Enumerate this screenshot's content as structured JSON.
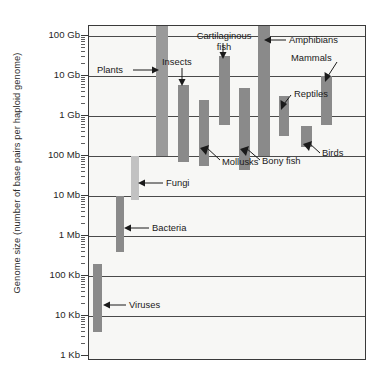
{
  "chart_data": {
    "type": "bar",
    "orientation": "vertical-range",
    "title": "",
    "xlabel": "",
    "ylabel": "Genome size (number of base pairs per haploid genome)",
    "yscale": "log",
    "ylim": [
      1000,
      200000000000
    ],
    "grid": true,
    "legend": "none",
    "ytick_labels": [
      "100 Gb",
      "10 Gb",
      "1 Gb",
      "100 Mb",
      "10 Mb",
      "1 Mb",
      "100 Kb",
      "10 Kb",
      "1 Kb"
    ],
    "ytick_values": [
      100000000000,
      10000000000,
      1000000000,
      100000000,
      10000000,
      1000000,
      100000,
      10000,
      1000
    ],
    "categories": [
      "Viruses",
      "Bacteria",
      "Fungi",
      "Plants",
      "Insects",
      "Mollusks",
      "Cartilaginous fish",
      "Bony fish",
      "Amphibians",
      "Reptiles",
      "Birds",
      "Mammals"
    ],
    "ranges": [
      {
        "name": "Viruses",
        "low": 4000,
        "high": 200000,
        "low_label": "4 Kb",
        "high_label": "200 Kb",
        "color": "#8a8a8a"
      },
      {
        "name": "Bacteria",
        "low": 400000,
        "high": 10000000,
        "low_label": "0.4 Mb",
        "high_label": "10 Mb",
        "color": "#8a8a8a"
      },
      {
        "name": "Fungi",
        "low": 8000000,
        "high": 100000000,
        "low_label": "8 Mb",
        "high_label": "100 Mb",
        "color": "#c2c2c2"
      },
      {
        "name": "Plants",
        "low": 100000000,
        "high": 200000000000,
        "low_label": "100 Mb",
        "high_label": "200 Gb",
        "color": "#9a9a9a"
      },
      {
        "name": "Insects",
        "low": 70000000,
        "high": 6000000000,
        "low_label": "70 Mb",
        "high_label": "6 Gb",
        "color": "#8a8a8a"
      },
      {
        "name": "Mollusks",
        "low": 55000000,
        "high": 2500000000,
        "low_label": "55 Mb",
        "high_label": "2.5 Gb",
        "color": "#8a8a8a"
      },
      {
        "name": "Cartilaginous fish",
        "low": 600000000,
        "high": 32000000000,
        "low_label": "0.6 Gb",
        "high_label": "32 Gb",
        "color": "#8a8a8a"
      },
      {
        "name": "Bony fish",
        "low": 45000000,
        "high": 5000000000,
        "low_label": "45 Mb",
        "high_label": "5 Gb",
        "color": "#8a8a8a"
      },
      {
        "name": "Amphibians",
        "low": 100000000,
        "high": 250000000000,
        "low_label": "100 Mb",
        "high_label": "250 Gb",
        "color": "#8a8a8a"
      },
      {
        "name": "Reptiles",
        "low": 320000000,
        "high": 3200000000,
        "low_label": "0.32 Gb",
        "high_label": "3.2 Gb",
        "color": "#8a8a8a"
      },
      {
        "name": "Birds",
        "low": 170000000,
        "high": 550000000,
        "low_label": "0.17 Gb",
        "high_label": "0.55 Gb",
        "color": "#8a8a8a"
      },
      {
        "name": "Mammals",
        "low": 600000000,
        "high": 10000000000,
        "low_label": "0.6 Gb",
        "high_label": "10 Gb",
        "color": "#8a8a8a"
      }
    ],
    "annotations": [
      {
        "label": "Plants"
      },
      {
        "label": "Insects"
      },
      {
        "label": "Cartilaginous\nfish"
      },
      {
        "label": "Amphibians"
      },
      {
        "label": "Mammals"
      },
      {
        "label": "Reptiles"
      },
      {
        "label": "Mollusks"
      },
      {
        "label": "Bony fish"
      },
      {
        "label": "Birds"
      },
      {
        "label": "Fungi"
      },
      {
        "label": "Bacteria"
      },
      {
        "label": "Viruses"
      }
    ]
  },
  "axis": {
    "y_title": "Genome size (number of base pairs per haploid genome)",
    "ticks": [
      {
        "label": "100 Gb"
      },
      {
        "label": "10 Gb"
      },
      {
        "label": "1 Gb"
      },
      {
        "label": "100 Mb"
      },
      {
        "label": "10 Mb"
      },
      {
        "label": "1 Mb"
      },
      {
        "label": "100 Kb"
      },
      {
        "label": "10 Kb"
      },
      {
        "label": "1 Kb"
      }
    ]
  },
  "labels": {
    "plants": "Plants",
    "insects": "Insects",
    "cartilaginous_fish_line1": "Cartilaginous",
    "cartilaginous_fish_line2": "fish",
    "amphibians": "Amphibians",
    "mammals": "Mammals",
    "reptiles": "Reptiles",
    "mollusks": "Mollusks",
    "bony_fish": "Bony fish",
    "birds": "Birds",
    "fungi": "Fungi",
    "bacteria": "Bacteria",
    "viruses": "Viruses"
  },
  "colors": {
    "plot_background": "#f7f7f5",
    "axis": "#3a3a3a",
    "gridline": "#4a4a4a",
    "bar_dark": "#8a8a8a",
    "bar_light": "#c2c2c2",
    "text": "#1a1a1a"
  }
}
